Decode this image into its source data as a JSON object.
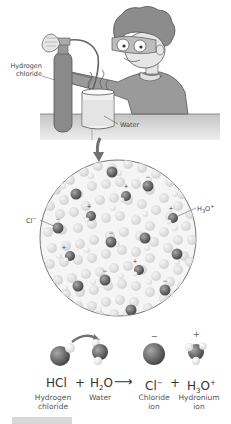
{
  "scene": {
    "labels": {
      "gas_cylinder_line1": "Hydrogen",
      "gas_cylinder_line2": "chloride",
      "beaker": "Water"
    }
  },
  "zoom_view": {
    "labels": {
      "chloride_ion": "Cl",
      "chloride_charge": "−",
      "hydronium_base": "H",
      "hydronium_sub": "3",
      "hydronium_o": "O",
      "hydronium_charge": "+"
    },
    "charges": {
      "negative": "−",
      "positive": "+"
    }
  },
  "equation": {
    "terms": [
      {
        "formula": "HCl",
        "name_line1": "Hydrogen",
        "name_line2": "chloride"
      },
      {
        "formula_base": "H",
        "formula_sub": "2",
        "formula_rest": "O",
        "name_line1": "Water",
        "name_line2": ""
      },
      {
        "formula": "Cl",
        "formula_sup": "−",
        "name_line1": "Chloride",
        "name_line2": "ion",
        "charge": "−"
      },
      {
        "formula_base": "H",
        "formula_sub": "3",
        "formula_rest": "O",
        "formula_sup": "+",
        "name_line1": "Hydronium",
        "name_line2": "ion",
        "charge": "+"
      }
    ],
    "plus": "+",
    "arrow": "⟶"
  },
  "colors": {
    "outline": "#555555",
    "cylinder": "#8a8a8a",
    "shirt": "#9a9a9a",
    "hair": "#8c8c8c",
    "skin": "#e6e6e6",
    "table": "#b8b8b8",
    "water": "#e8e8e8",
    "water_molecule": "#dcdcdc",
    "ion_dark": "#6e6e6e",
    "accent_arrow": "#707070",
    "footer_bar": "#d8d8d8"
  }
}
